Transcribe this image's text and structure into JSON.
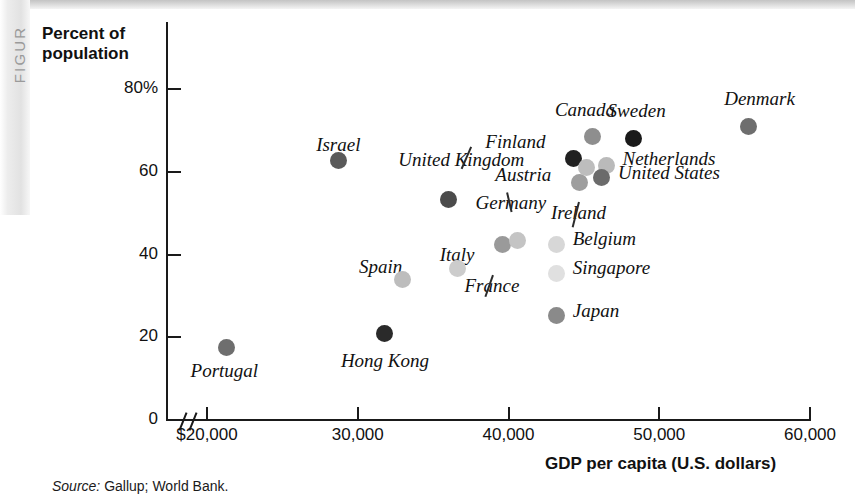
{
  "figure_tab": "FIGUR",
  "axis": {
    "y_title_line1": "Percent of",
    "y_title_line2": "population",
    "y_ticks": [
      "80%",
      "60",
      "40",
      "20",
      "0"
    ],
    "x_title": "GDP per capita (U.S. dollars)",
    "x_ticks": [
      "$20,000",
      "30,000",
      "40,000",
      "50,000",
      "60,000"
    ]
  },
  "source": {
    "prefix": "Source:",
    "text": " Gallup; World Bank."
  },
  "chart_data": {
    "type": "scatter",
    "title": "",
    "xlabel": "GDP per capita (U.S. dollars)",
    "ylabel": "Percent of population",
    "xlim": [
      20000,
      60000
    ],
    "ylim": [
      0,
      85
    ],
    "x_ticks": [
      20000,
      30000,
      40000,
      50000,
      60000
    ],
    "y_ticks": [
      0,
      20,
      40,
      60,
      80
    ],
    "grid": false,
    "legend": false,
    "axis_break_x": true,
    "points": [
      {
        "name": "Portugal",
        "x": 21300,
        "y": 17.5,
        "color": "#6e6e6e",
        "label_dx": -36,
        "label_dy": 22,
        "leader": false
      },
      {
        "name": "Hong Kong",
        "x": 31800,
        "y": 20.8,
        "color": "#2a2a2a",
        "label_dx": -44,
        "label_dy": 26,
        "leader": false
      },
      {
        "name": "Spain",
        "x": 33000,
        "y": 33.9,
        "color": "#bdbdbd",
        "label_dx": -44,
        "label_dy": -14,
        "leader": false
      },
      {
        "name": "Italy",
        "x": 36600,
        "y": 36.7,
        "color": "#cccccc",
        "label_dx": -8,
        "label_dy": -14,
        "leader": false
      },
      {
        "name": "Israel",
        "x": 28700,
        "y": 62.8,
        "color": "#5a5a5a",
        "label_dx": -10,
        "label_dy": -16,
        "leader": false
      },
      {
        "name": "United Kingdom",
        "x": 36000,
        "y": 53.4,
        "color": "#4b4b4b",
        "label_dx": -50,
        "label_dy": -40,
        "leader": true
      },
      {
        "name": "France",
        "x": 39600,
        "y": 42.3,
        "color": "#9a9a9a",
        "label_dx": -38,
        "label_dy": 40,
        "leader": true
      },
      {
        "name": "Germany",
        "x": 40600,
        "y": 43.4,
        "color": "#c4c4c4",
        "label_dx": -42,
        "label_dy": -38,
        "leader": true
      },
      {
        "name": "Belgium",
        "x": 43200,
        "y": 42.5,
        "color": "#d7d7d7",
        "label_dx": 16,
        "label_dy": -6,
        "leader": false
      },
      {
        "name": "Singapore",
        "x": 43200,
        "y": 35.5,
        "color": "#e0e0e0",
        "label_dx": 16,
        "label_dy": -6,
        "leader": false
      },
      {
        "name": "Japan",
        "x": 43200,
        "y": 25.2,
        "color": "#8a8a8a",
        "label_dx": 16,
        "label_dy": -6,
        "leader": false
      },
      {
        "name": "Austria",
        "x": 44700,
        "y": 57.4,
        "color": "#9e9e9e",
        "label_dx": -84,
        "label_dy": -9,
        "leader": false
      },
      {
        "name": "Finland",
        "x": 44300,
        "y": 63.1,
        "color": "#212121",
        "label_dx": -88,
        "label_dy": -18,
        "leader": false
      },
      {
        "name": "Canada",
        "x": 45600,
        "y": 68.5,
        "color": "#8e8e8e",
        "label_dx": -38,
        "label_dy": -28,
        "leader": false
      },
      {
        "name": "Ireland",
        "x": 45200,
        "y": 61.0,
        "color": "#bdbdbd",
        "label_dx": -36,
        "label_dy": 44,
        "leader": true
      },
      {
        "name": "Netherlands",
        "x": 46500,
        "y": 61.4,
        "color": "#bababa",
        "label_dx": 16,
        "label_dy": -8,
        "leader": false
      },
      {
        "name": "United States",
        "x": 46200,
        "y": 58.6,
        "color": "#6b6b6b",
        "label_dx": 16,
        "label_dy": -6,
        "leader": false
      },
      {
        "name": "Sweden",
        "x": 48300,
        "y": 68.1,
        "color": "#1a1a1a",
        "label_dx": -26,
        "label_dy": -28,
        "leader": false
      },
      {
        "name": "Denmark",
        "x": 55900,
        "y": 71.0,
        "color": "#6e6e6e",
        "label_dx": -24,
        "label_dy": -28,
        "leader": false
      }
    ]
  }
}
